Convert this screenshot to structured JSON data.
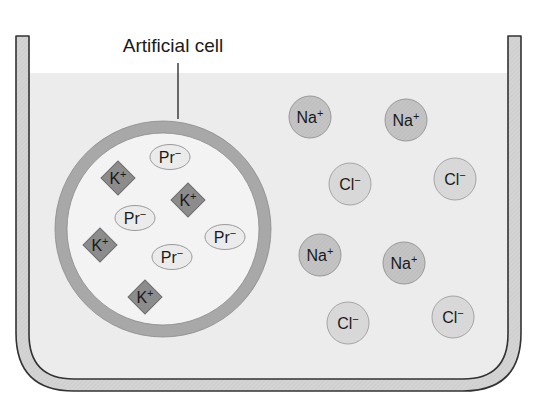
{
  "diagram": {
    "type": "artificial-cell-in-solution",
    "label": {
      "text": "Artificial cell",
      "x": 173,
      "y": 52,
      "leader": {
        "x": 178,
        "y1": 63,
        "y2": 119
      }
    },
    "container": {
      "left_outer": 16,
      "left_inner": 29,
      "right_inner": 508,
      "right_outer": 521,
      "top": 36,
      "bottom_inner": 379,
      "bottom_outer": 391,
      "water_line": 73,
      "wall_fill": "#d4d4d4",
      "wall_stroke": "#333333",
      "water_fill": "#ececec"
    },
    "cell": {
      "cx": 163,
      "cy": 229,
      "r_outer": 108,
      "ring_width": 12,
      "ring_fill": "#a8a8a8",
      "ring_stroke": "#8a8a8a",
      "interior_fill": "#f3f3f3"
    },
    "colors": {
      "k_fill": "#8c8c8c",
      "k_stroke": "#6e6e6e",
      "pr_fill": "#ebebeb",
      "pr_stroke": "#9a9a9a",
      "na_fill": "#c4c4c4",
      "na_stroke": "#9a9a9a",
      "cl_fill": "#d8d8d8",
      "cl_stroke": "#a5a5a5"
    },
    "inside_ions": [
      {
        "symbol": "K",
        "charge": "+",
        "shape": "diamond",
        "x": 118,
        "y": 178
      },
      {
        "symbol": "K",
        "charge": "+",
        "shape": "diamond",
        "x": 188,
        "y": 200
      },
      {
        "symbol": "K",
        "charge": "+",
        "shape": "diamond",
        "x": 100,
        "y": 245
      },
      {
        "symbol": "K",
        "charge": "+",
        "shape": "diamond",
        "x": 145,
        "y": 297
      },
      {
        "symbol": "Pr",
        "charge": "-",
        "shape": "ellipse",
        "x": 170,
        "y": 157
      },
      {
        "symbol": "Pr",
        "charge": "-",
        "shape": "ellipse",
        "x": 135,
        "y": 218
      },
      {
        "symbol": "Pr",
        "charge": "-",
        "shape": "ellipse",
        "x": 225,
        "y": 237
      },
      {
        "symbol": "Pr",
        "charge": "-",
        "shape": "ellipse",
        "x": 172,
        "y": 257
      }
    ],
    "outside_ions": [
      {
        "symbol": "Na",
        "charge": "+",
        "shape": "circle",
        "x": 310,
        "y": 117
      },
      {
        "symbol": "Na",
        "charge": "+",
        "shape": "circle",
        "x": 406,
        "y": 120
      },
      {
        "symbol": "Cl",
        "charge": "-",
        "shape": "circle",
        "x": 350,
        "y": 184
      },
      {
        "symbol": "Cl",
        "charge": "-",
        "shape": "circle",
        "x": 455,
        "y": 179
      },
      {
        "symbol": "Na",
        "charge": "+",
        "shape": "circle",
        "x": 320,
        "y": 255
      },
      {
        "symbol": "Na",
        "charge": "+",
        "shape": "circle",
        "x": 404,
        "y": 263
      },
      {
        "symbol": "Cl",
        "charge": "-",
        "shape": "circle",
        "x": 348,
        "y": 323
      },
      {
        "symbol": "Cl",
        "charge": "-",
        "shape": "circle",
        "x": 453,
        "y": 317
      }
    ]
  }
}
